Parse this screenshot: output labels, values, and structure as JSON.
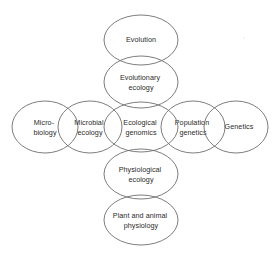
{
  "diagram": {
    "type": "venn-cross-overlapping-ellipses",
    "background_color": "#ffffff",
    "stroke_color": "#6e6e6e",
    "text_color": "#2b2b2b",
    "nodes": [
      {
        "id": "evolution",
        "label": "Evolution",
        "lines": [
          "Evolution"
        ],
        "cx": 141,
        "cy": 40,
        "rx": 37,
        "ry": 25,
        "position": "top-outer"
      },
      {
        "id": "evolutionary-ecology",
        "label": "Evolutionary ecology",
        "lines": [
          "Evolutionary",
          "ecology"
        ],
        "cx": 141,
        "cy": 82,
        "rx": 37,
        "ry": 26,
        "position": "top-inner"
      },
      {
        "id": "microbiology",
        "label": "Micro-biology",
        "lines": [
          "Micro-",
          "biology"
        ],
        "cx": 45,
        "cy": 127,
        "rx": 33,
        "ry": 26,
        "position": "left-outer"
      },
      {
        "id": "microbial-ecology",
        "label": "Microbial ecology",
        "lines": [
          "Microbial",
          "ecology"
        ],
        "cx": 90,
        "cy": 127,
        "rx": 32,
        "ry": 26,
        "position": "left-inner"
      },
      {
        "id": "ecological-genomics",
        "label": "Ecological genomics",
        "lines": [
          "Ecological",
          "genomics"
        ],
        "cx": 141,
        "cy": 127,
        "rx": 37,
        "ry": 25,
        "position": "center"
      },
      {
        "id": "population-genetics",
        "label": "Population genetics",
        "lines": [
          "Population",
          "genetics"
        ],
        "cx": 193,
        "cy": 127,
        "rx": 32,
        "ry": 26,
        "position": "right-inner"
      },
      {
        "id": "genetics",
        "label": "Genetics",
        "lines": [
          "Genetics"
        ],
        "cx": 236,
        "cy": 127,
        "rx": 32,
        "ry": 26,
        "position": "right-outer"
      },
      {
        "id": "physiological-ecology",
        "label": "Physiological ecology",
        "lines": [
          "Physiological",
          "ecology"
        ],
        "cx": 141,
        "cy": 174,
        "rx": 37,
        "ry": 25,
        "position": "bottom-inner"
      },
      {
        "id": "plant-and-animal-physiology",
        "label": "Plant and animal physiology",
        "lines": [
          "Plant and animal",
          "physiology"
        ],
        "cx": 141,
        "cy": 220,
        "rx": 37,
        "ry": 25,
        "position": "bottom-outer"
      }
    ]
  }
}
